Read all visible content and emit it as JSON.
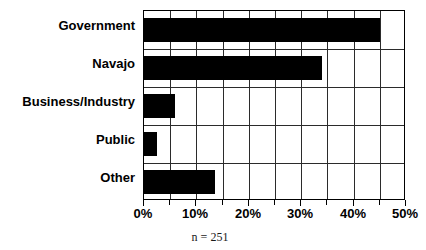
{
  "chart_data": {
    "type": "bar",
    "orientation": "horizontal",
    "title": "",
    "subtitle": "",
    "xlabel": "",
    "ylabel": "",
    "categories": [
      "Government",
      "Navajo",
      "Business/Industry",
      "Public",
      "Other"
    ],
    "values": [
      45,
      34,
      6,
      2.5,
      13.5
    ],
    "value_unit": "%",
    "xlim": [
      0,
      50
    ],
    "xtick_values": [
      0,
      10,
      20,
      30,
      40,
      50
    ],
    "xtick_labels": [
      "0%",
      "10%",
      "20%",
      "30%",
      "40%",
      "50%"
    ],
    "minor_tick_step": 5,
    "grid": true,
    "grid_axis": "both",
    "legend": false,
    "legend_position": "none",
    "annotations": [
      "n = 251"
    ],
    "series": [
      {
        "name": "Share of respondents",
        "color": "#000000",
        "values": [
          45,
          34,
          6,
          2.5,
          13.5
        ]
      }
    ]
  },
  "caption": {
    "text": "n = 251"
  },
  "colors": {
    "bar": "#000000",
    "grid": "#2b2b2b",
    "frame": "#000000",
    "background": "#ffffff",
    "text": "#000000"
  }
}
